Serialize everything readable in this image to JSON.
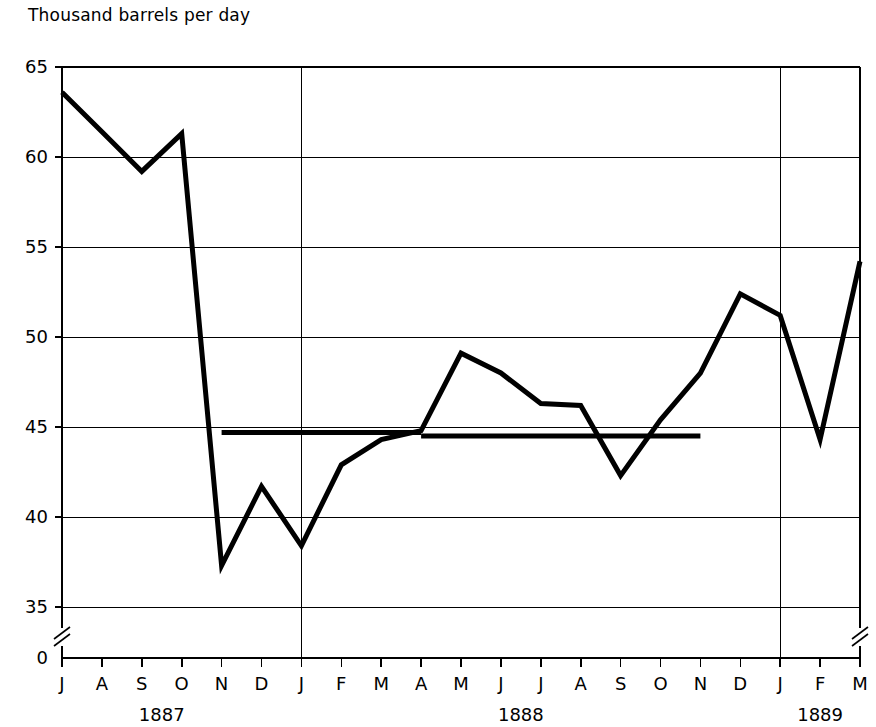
{
  "chart_data": {
    "type": "line",
    "title": "Thousand barrels per day",
    "ylabel": "Thousand barrels per day",
    "xlabel": "",
    "ylim": [
      33.5,
      65
    ],
    "yticks": [
      35,
      40,
      45,
      50,
      55,
      60,
      65
    ],
    "ytick_labels": [
      "35",
      "40",
      "45",
      "50",
      "55",
      "60",
      "65"
    ],
    "y_origin_label": "0",
    "axis_break": true,
    "grid": true,
    "grid_orientation": "both",
    "legend": "none",
    "x": [
      "J",
      "A",
      "S",
      "O",
      "N",
      "D",
      "J",
      "F",
      "M",
      "A",
      "M",
      "J",
      "J",
      "A",
      "S",
      "O",
      "N",
      "D",
      "J",
      "F",
      "M"
    ],
    "xtick_labels": [
      "J",
      "A",
      "S",
      "O",
      "N",
      "D",
      "J",
      "F",
      "M",
      "A",
      "M",
      "J",
      "J",
      "A",
      "S",
      "O",
      "N",
      "D",
      "J",
      "F",
      "M"
    ],
    "year_labels": [
      {
        "text": "1887",
        "at_index": 2.5
      },
      {
        "text": "1888",
        "at_index": 11.5
      },
      {
        "text": "1889",
        "at_index": 19.0
      }
    ],
    "year_dividers": [
      6,
      18
    ],
    "series": [
      {
        "name": "Production",
        "values": [
          63.6,
          61.4,
          59.2,
          61.3,
          37.3,
          41.7,
          38.4,
          42.9,
          44.3,
          44.8,
          49.1,
          48.0,
          46.3,
          46.2,
          42.3,
          45.4,
          48.0,
          52.4,
          51.2,
          44.3,
          54.2
        ]
      }
    ],
    "reference_lines": [
      {
        "name": "average-1",
        "value": 44.7,
        "x_start_index": 4,
        "x_end_index": 9
      },
      {
        "name": "average-2",
        "value": 44.5,
        "x_start_index": 9,
        "x_end_index": 16
      }
    ]
  }
}
